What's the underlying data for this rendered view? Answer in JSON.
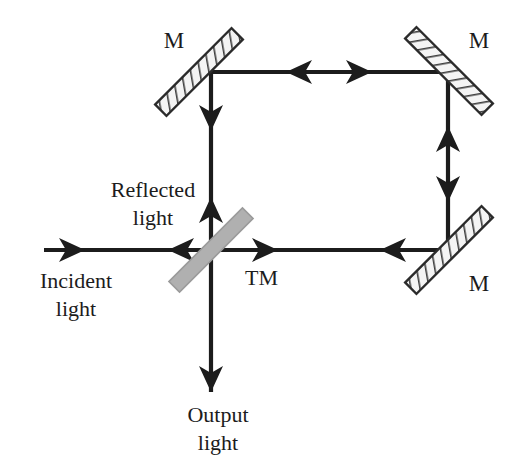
{
  "figure": {
    "background_color": "#ffffff",
    "width": 515,
    "height": 471
  },
  "colors": {
    "beam": "#1c1c1c",
    "mirror_outline": "#2b2b2b",
    "mirror_fill": "#f2f2f2",
    "mirror_hatch": "#4a4a4a",
    "beamsplitter_fill": "#b0b0b0",
    "beamsplitter_outline": "#8f8f8f",
    "text": "#1c1c1c"
  },
  "labels": {
    "mirror_top_left": "M",
    "mirror_top_right": "M",
    "mirror_bottom_right": "M",
    "beam_splitter": "TM",
    "incident_line1": "Incident",
    "incident_line2": "light",
    "reflected_line1": "Reflected",
    "reflected_line2": "light",
    "output_line1": "Output",
    "output_line2": "light"
  },
  "components": [
    {
      "name": "mirror-top-left",
      "type": "mirror",
      "label": "M",
      "center": [
        199,
        72
      ],
      "angle_deg": -45,
      "length": 108,
      "thickness": 16,
      "hatched": true
    },
    {
      "name": "mirror-top-right",
      "type": "mirror",
      "label": "M",
      "center": [
        449,
        71
      ],
      "angle_deg": 45,
      "length": 108,
      "thickness": 16,
      "hatched": true
    },
    {
      "name": "mirror-bottom-right",
      "type": "mirror",
      "label": "M",
      "center": [
        449,
        250
      ],
      "angle_deg": -45,
      "length": 108,
      "thickness": 16,
      "hatched": true
    },
    {
      "name": "beam-splitter-tm",
      "type": "beam-splitter",
      "label": "TM",
      "center": [
        211,
        250
      ],
      "angle_deg": -45,
      "length": 104,
      "thickness": 15,
      "hatched": false
    }
  ],
  "beam_paths": {
    "ring_top_y": 72,
    "ring_bottom_y": 250,
    "ring_left_x": 211,
    "ring_right_x": 448,
    "incident_start_x": 44,
    "output_end_y": 392,
    "segments": [
      {
        "name": "incident-beam",
        "from": [
          44,
          250
        ],
        "to": [
          211,
          250
        ]
      },
      {
        "name": "ring-top",
        "from": [
          211,
          72
        ],
        "to": [
          448,
          72
        ]
      },
      {
        "name": "ring-left",
        "from": [
          211,
          72
        ],
        "to": [
          211,
          250
        ]
      },
      {
        "name": "ring-right",
        "from": [
          448,
          72
        ],
        "to": [
          448,
          250
        ]
      },
      {
        "name": "ring-bottom",
        "from": [
          211,
          250
        ],
        "to": [
          448,
          250
        ]
      },
      {
        "name": "output-beam",
        "from": [
          211,
          250
        ],
        "to": [
          211,
          392
        ]
      }
    ],
    "arrows": [
      {
        "name": "arrow-incident-right",
        "at": [
          85,
          250
        ],
        "direction": "right"
      },
      {
        "name": "arrow-reflected-left",
        "at": [
          168,
          250
        ],
        "direction": "left"
      },
      {
        "name": "arrow-top-left",
        "at": [
          290,
          72
        ],
        "direction": "left"
      },
      {
        "name": "arrow-top-right",
        "at": [
          368,
          72
        ],
        "direction": "right"
      },
      {
        "name": "arrow-left-down",
        "at": [
          211,
          125
        ],
        "direction": "down"
      },
      {
        "name": "arrow-left-up",
        "at": [
          211,
          203
        ],
        "direction": "up"
      },
      {
        "name": "arrow-right-up",
        "at": [
          448,
          125
        ],
        "direction": "up"
      },
      {
        "name": "arrow-right-down",
        "at": [
          448,
          196
        ],
        "direction": "down"
      },
      {
        "name": "arrow-bottom-right",
        "at": [
          272,
          250
        ],
        "direction": "right"
      },
      {
        "name": "arrow-bottom-left",
        "at": [
          385,
          250
        ],
        "direction": "left"
      },
      {
        "name": "arrow-output-down",
        "at": [
          211,
          385
        ],
        "direction": "down"
      }
    ]
  },
  "text_positions": {
    "mirror_top_left_label": [
      174,
      48
    ],
    "mirror_top_right_label": [
      479,
      48
    ],
    "mirror_bottom_right_label": [
      479,
      291
    ],
    "beam_splitter_label": [
      245,
      285
    ],
    "incident_line1": [
      76,
      288
    ],
    "incident_line2": [
      76,
      316
    ],
    "reflected_line1": [
      153,
      197
    ],
    "reflected_line2": [
      153,
      225
    ],
    "output_line1": [
      218,
      422
    ],
    "output_line2": [
      218,
      450
    ]
  }
}
